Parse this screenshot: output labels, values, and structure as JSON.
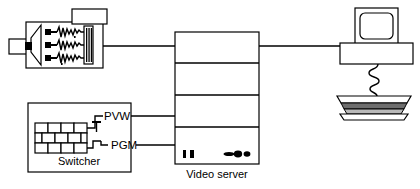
{
  "diagram": {
    "colors": {
      "line": "#000000",
      "background": "#ffffff",
      "shade_light": "#b8b8b8",
      "shade_dark": "#6e6e6e"
    },
    "nodes": {
      "camera": {
        "name": "camera",
        "caption": "",
        "icon": "camera-icon",
        "detail": "camera body with lens, viewfinder block on top and three internal circuit/waveform rows"
      },
      "switcher": {
        "name": "switcher",
        "caption": "Switcher",
        "icon": "switcher-icon",
        "detail": "control panel with two offset rows of square buttons",
        "ports": [
          {
            "label": "PVW",
            "name": "preview-output"
          },
          {
            "label": "PGM",
            "name": "program-output"
          }
        ]
      },
      "video_server": {
        "name": "video-server",
        "caption": "Video server",
        "icon": "server-tower-icon",
        "bays": 4,
        "front_panel": {
          "slots": 2,
          "indicators": 3
        }
      },
      "workstation": {
        "name": "workstation",
        "caption": "",
        "icon": "computer-monitor-icon",
        "detail": "CRT monitor on horizontal base unit with coiled cable to keyboard"
      }
    },
    "connections": [
      {
        "name": "camera-to-server",
        "from": "camera",
        "to": "video_server"
      },
      {
        "name": "pvw-to-server",
        "from": "switcher",
        "to": "video_server",
        "label": "PVW"
      },
      {
        "name": "pgm-to-server",
        "from": "switcher",
        "to": "video_server",
        "label": "PGM"
      },
      {
        "name": "server-to-workstation",
        "from": "video_server",
        "to": "workstation"
      }
    ]
  }
}
